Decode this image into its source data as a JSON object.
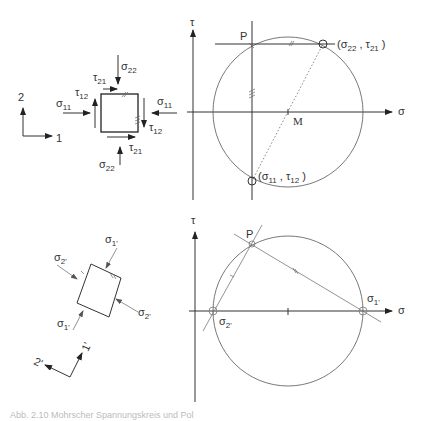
{
  "figure": {
    "top_left": {
      "axes": {
        "axis_2": "2",
        "axis_1": "1"
      },
      "stress_labels": {
        "sigma22_top": "σ",
        "sigma22_top_sub": "22",
        "sigma22_bottom": "σ",
        "sigma22_bottom_sub": "22",
        "sigma11_left": "σ",
        "sigma11_left_sub": "11",
        "sigma11_right": "σ",
        "sigma11_right_sub": "11",
        "tau21_top": "τ",
        "tau21_top_sub": "21",
        "tau21_bottom": "τ",
        "tau21_bottom_sub": "21",
        "tau12_left": "τ",
        "tau12_left_sub": "12",
        "tau12_right": "τ",
        "tau12_right_sub": "12"
      }
    },
    "top_right": {
      "tau_axis_label": "τ",
      "sigma_axis_label": "σ",
      "pole_label": "P",
      "center_label": "M",
      "point_a": {
        "open": "(σ",
        "sub1": "22",
        "mid": " , τ",
        "sub2": "21",
        "close": " )"
      },
      "point_b": {
        "open": "(σ",
        "sub1": "11",
        "mid": " , τ",
        "sub2": "12",
        "close": " )"
      }
    },
    "bottom_left": {
      "axes": {
        "axis_2p": "2'",
        "axis_1p": "1'"
      },
      "stress_labels": {
        "sigma1p_top": "σ",
        "sigma1p_top_sub": "1'",
        "sigma1p_bottom": "σ",
        "sigma1p_bottom_sub": "1'",
        "sigma2p_left": "σ",
        "sigma2p_left_sub": "2'",
        "sigma2p_right": "σ",
        "sigma2p_right_sub": "2'"
      }
    },
    "bottom_right": {
      "tau_axis_label": "τ",
      "sigma_axis_label": "σ",
      "pole_label": "P",
      "sigma1p": "σ",
      "sigma1p_sub": "1'",
      "sigma2p": "σ",
      "sigma2p_sub": "2'"
    },
    "caption_fragment": "Abb. 2.10 Mohrscher Spannungskreis und Pol"
  }
}
